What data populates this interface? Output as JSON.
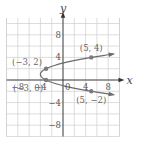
{
  "chart_data": {
    "type": "line",
    "title": "",
    "xlabel": "x",
    "ylabel": "y",
    "xlim": [
      -10,
      10
    ],
    "ylim": [
      -10,
      11
    ],
    "grid": true,
    "grid_step": 2,
    "x_ticks": [
      {
        "value": -8,
        "label": "−8"
      },
      {
        "value": -4,
        "label": "−4"
      },
      {
        "value": 4,
        "label": "4"
      },
      {
        "value": 8,
        "label": "8"
      }
    ],
    "y_ticks": [
      {
        "value": 8,
        "label": "8"
      },
      {
        "value": 4,
        "label": "4"
      },
      {
        "value": -4,
        "label": "−4"
      },
      {
        "value": -8,
        "label": "−8"
      }
    ],
    "origin_label": "0",
    "series": [
      {
        "name": "x = (y − 1)² − 4",
        "kind": "sideways-parabola",
        "vertex": [
          -4,
          1
        ],
        "y_range": [
          -2.6,
          4.6
        ],
        "color": "#6a6a6a"
      }
    ],
    "points": [
      {
        "x": -3,
        "y": 2,
        "label": "(−3, 2)"
      },
      {
        "x": 5,
        "y": 4,
        "label": "(5, 4)"
      },
      {
        "x": -3,
        "y": 0,
        "label": "(−3, 0)"
      },
      {
        "x": 5,
        "y": -2,
        "label": "(5, −2)"
      }
    ]
  }
}
